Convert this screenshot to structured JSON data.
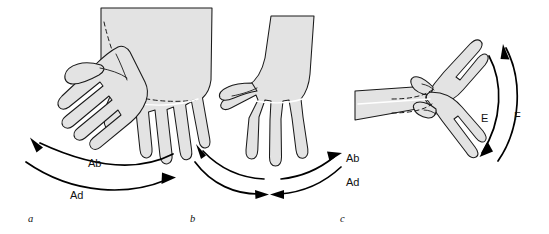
{
  "figure": {
    "background_color": "#ffffff",
    "hand_fill_color": "#e3e3e3",
    "outline_color": "#1a1a1a",
    "arrow_color": "#000000",
    "width": 549,
    "height": 234
  },
  "panels": [
    {
      "letter": "a",
      "description": "Two overlapping hands, palmar view, showing radial and ulnar deviation of the wrist",
      "labels": [
        {
          "text": "Ab",
          "meaning": "abduction"
        },
        {
          "text": "Ad",
          "meaning": "adduction"
        }
      ]
    },
    {
      "letter": "b",
      "description": "Single hand, dorsal view, fingers pointing down, with paired arcs for abduction and adduction",
      "labels": [
        {
          "text": "Ab",
          "meaning": "abduction"
        },
        {
          "text": "Ad",
          "meaning": "adduction"
        }
      ]
    },
    {
      "letter": "c",
      "description": "Lateral view of forearm and hand showing wrist extension and flexion",
      "labels": [
        {
          "text": "E",
          "meaning": "extension"
        },
        {
          "text": "F",
          "meaning": "flexion"
        }
      ]
    }
  ],
  "panel_letters": {
    "a": "a",
    "b": "b",
    "c": "c"
  },
  "panel_a_labels": {
    "ab": "Ab",
    "ad": "Ad"
  },
  "panel_b_labels": {
    "ab": "Ab",
    "ad": "Ad"
  },
  "panel_c_labels": {
    "e": "E",
    "f": "F"
  }
}
